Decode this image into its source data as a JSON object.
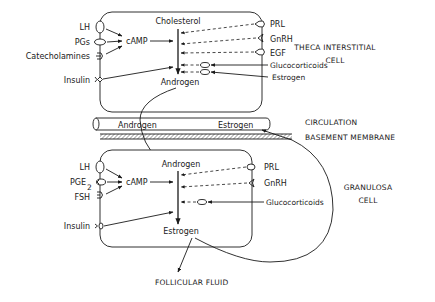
{
  "theca_cell": {
    "title_line1": "THECA INTERSTITIAL",
    "title_line2": "CELL",
    "left_receptors": [
      {
        "label": "LH",
        "shape": "oval-vertical"
      },
      {
        "label": "PGs",
        "shape": "oval-horizontal"
      },
      {
        "label": "Catecholamines",
        "shape": "cup-receptor"
      },
      {
        "label": "Insulin",
        "shape": "diamond-receptor"
      }
    ],
    "right_receptors": [
      {
        "label": "PRL",
        "shape": "oval-pointed"
      },
      {
        "label": "GnRH",
        "shape": "notch-receptor"
      },
      {
        "label": "EGF",
        "shape": "oval-pointed"
      }
    ],
    "intracellular_inputs": [
      {
        "label": "Glucocorticoids"
      },
      {
        "label": "Estrogen"
      }
    ],
    "second_messenger": "cAMP",
    "substrate": "Cholesterol",
    "product": "Androgen"
  },
  "circulation": {
    "label": "CIRCULATION",
    "vessel_left_text": "Androgen",
    "vessel_right_text": "Estrogen"
  },
  "basement_membrane": {
    "label": "BASEMENT MEMBRANE"
  },
  "granulosa_cell": {
    "title_line1": "GRANULOSA",
    "title_line2": "CELL",
    "left_receptors": [
      {
        "label": "LH",
        "shape": "oval-vertical"
      },
      {
        "label": "PGE",
        "subscript": "2",
        "shape": "cup-oval"
      },
      {
        "label": "FSH",
        "shape": "cup-receptor"
      },
      {
        "label": "Insulin",
        "shape": "diamond-receptor"
      }
    ],
    "right_receptors": [
      {
        "label": "PRL",
        "shape": "oval"
      },
      {
        "label": "GnRH",
        "shape": "notch-receptor"
      }
    ],
    "intracellular_inputs": [
      {
        "label": "Glucocorticoids"
      }
    ],
    "second_messenger": "cAMP",
    "substrate": "Androgen",
    "product": "Estrogen"
  },
  "follicular_fluid": {
    "label": "FOLLICULAR FLUID"
  }
}
